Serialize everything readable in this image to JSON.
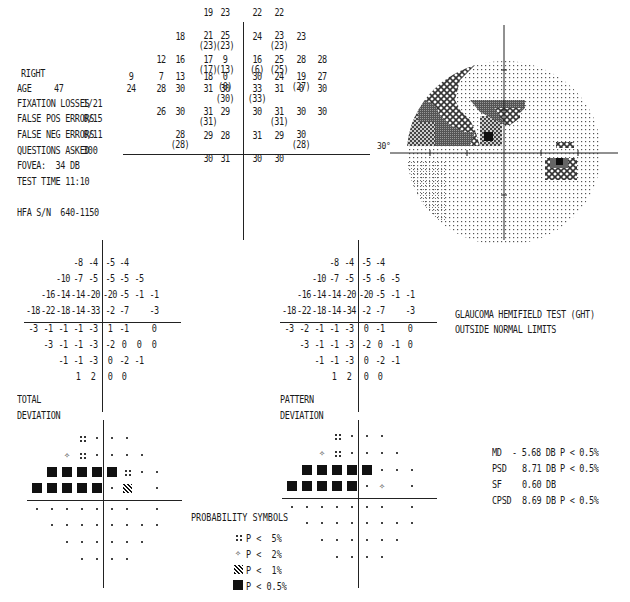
{
  "header": {
    "eye": "RIGHT",
    "age_label": "AGE",
    "age_value": "47",
    "fixation_label": "FIXATION LOSSES",
    "fixation_value": "1/21",
    "false_pos_label": "FALSE POS ERRORS",
    "false_pos_value": "0/15",
    "false_neg_label": "FALSE NEG ERRORS",
    "false_neg_value": "0/11",
    "questions_label": "QUESTIONS ASKED",
    "questions_value": "300",
    "fovea": "FOVEA:  34 DB",
    "test_time": "TEST TIME 11:10",
    "serial": "HFA S/N  640-1150"
  },
  "sensitivity": {
    "rows": [
      {
        "y": 15,
        "cells": [
          {
            "c": 3,
            "v": "19"
          },
          {
            "c": 4,
            "v": "23"
          },
          {
            "c": 5,
            "v": "22"
          },
          {
            "c": 6,
            "v": "22"
          }
        ]
      },
      {
        "y": 40,
        "cells": [
          {
            "c": 2,
            "v": "18"
          },
          {
            "c": 3,
            "v": "21",
            "s": "(23)"
          },
          {
            "c": 4,
            "v": "25",
            "s": "(23)"
          },
          {
            "c": 5,
            "v": "24"
          },
          {
            "c": 6,
            "v": "23",
            "s": "(23)"
          },
          {
            "c": 7,
            "v": "23"
          }
        ]
      },
      {
        "y": 64,
        "cells": [
          {
            "c": 1,
            "v": "12"
          },
          {
            "c": 2,
            "v": "16"
          },
          {
            "c": 3,
            "v": "17",
            "s": "(17)"
          },
          {
            "c": 4,
            "v": "9",
            "s": "(13)"
          },
          {
            "c": 5,
            "v": "16",
            "s": "(6)"
          },
          {
            "c": 6,
            "v": "25",
            "s": "(25)"
          },
          {
            "c": 7,
            "v": "28"
          },
          {
            "c": 8,
            "v": "28"
          }
        ]
      },
      {
        "y": 88,
        "cells": [
          {
            "c": 0,
            "v": "9"
          },
          {
            "c": 1,
            "v": "7"
          },
          {
            "c": 2,
            "v": "13"
          },
          {
            "c": 3,
            "v": "18"
          },
          {
            "c": 4,
            "v": "0",
            "s": "(0)"
          },
          {
            "c": 5,
            "v": "30"
          },
          {
            "c": 6,
            "v": "24"
          },
          {
            "c": 7,
            "v": "19",
            "s": "(27)"
          },
          {
            "c": 8,
            "v": "27"
          }
        ]
      },
      {
        "y": 106,
        "cells": [
          {
            "c": 0,
            "v": "24"
          },
          {
            "c": 1,
            "v": "28"
          },
          {
            "c": 2,
            "v": "30"
          },
          {
            "c": 3,
            "v": "31"
          },
          {
            "c": 4,
            "v": "30",
            "s": "(30)"
          },
          {
            "c": 5,
            "v": "33",
            "s": "(33)"
          },
          {
            "c": 6,
            "v": "31"
          },
          {
            "c": 7,
            "v": "0"
          },
          {
            "c": 8,
            "v": "30"
          }
        ]
      },
      {
        "y": 131,
        "cells": [
          {
            "c": 1,
            "v": "26"
          },
          {
            "c": 2,
            "v": "30"
          },
          {
            "c": 3,
            "v": "31",
            "s": "(31)"
          },
          {
            "c": 4,
            "v": "29"
          },
          {
            "c": 5,
            "v": "30"
          },
          {
            "c": 6,
            "v": "31",
            "s": "(31)"
          },
          {
            "c": 7,
            "v": "30"
          },
          {
            "c": 8,
            "v": "30"
          }
        ]
      },
      {
        "y": 154,
        "cells": [
          {
            "c": 2,
            "v": "28",
            "s": "(28)"
          },
          {
            "c": 3,
            "v": "29"
          },
          {
            "c": 4,
            "v": "28"
          },
          {
            "c": 5,
            "v": "31"
          },
          {
            "c": 6,
            "v": "29"
          },
          {
            "c": 7,
            "v": "30",
            "s": "(28)"
          }
        ]
      },
      {
        "y": 178,
        "cells": [
          {
            "c": 3,
            "v": "30"
          },
          {
            "c": 4,
            "v": "31"
          },
          {
            "c": 5,
            "v": "30"
          },
          {
            "c": 6,
            "v": "30"
          }
        ]
      }
    ]
  },
  "grayscale": {
    "label_30": "30°"
  },
  "total_deviation": {
    "label_line1": "TOTAL",
    "label_line2": "DEVIATION",
    "rows": [
      {
        "cells": [
          {
            "c": 3,
            "v": "-8"
          },
          {
            "c": 4,
            "v": "-4"
          },
          {
            "c": 5,
            "v": "-5"
          },
          {
            "c": 6,
            "v": "-4"
          }
        ]
      },
      {
        "cells": [
          {
            "c": 2,
            "v": "-10"
          },
          {
            "c": 3,
            "v": "-7"
          },
          {
            "c": 4,
            "v": "-5"
          },
          {
            "c": 5,
            "v": "-5"
          },
          {
            "c": 6,
            "v": "-5"
          },
          {
            "c": 7,
            "v": "-5"
          }
        ]
      },
      {
        "cells": [
          {
            "c": 1,
            "v": "-16"
          },
          {
            "c": 2,
            "v": "-14"
          },
          {
            "c": 3,
            "v": "-14"
          },
          {
            "c": 4,
            "v": "-20"
          },
          {
            "c": 5,
            "v": "-20"
          },
          {
            "c": 6,
            "v": "-5"
          },
          {
            "c": 7,
            "v": "-1"
          },
          {
            "c": 8,
            "v": "-1"
          }
        ]
      },
      {
        "cells": [
          {
            "c": 0,
            "v": "-18"
          },
          {
            "c": 1,
            "v": "-22"
          },
          {
            "c": 2,
            "v": "-18"
          },
          {
            "c": 3,
            "v": "-14"
          },
          {
            "c": 4,
            "v": "-33"
          },
          {
            "c": 5,
            "v": "-2"
          },
          {
            "c": 6,
            "v": "-7"
          },
          {
            "c": 8,
            "v": "-3"
          }
        ]
      },
      {
        "cells": [
          {
            "c": 0,
            "v": "-3"
          },
          {
            "c": 1,
            "v": "-1"
          },
          {
            "c": 2,
            "v": "-1"
          },
          {
            "c": 3,
            "v": "-1"
          },
          {
            "c": 4,
            "v": "-3"
          },
          {
            "c": 5,
            "v": "1"
          },
          {
            "c": 6,
            "v": "-1"
          },
          {
            "c": 8,
            "v": "0"
          }
        ]
      },
      {
        "cells": [
          {
            "c": 1,
            "v": "-3"
          },
          {
            "c": 2,
            "v": "-1"
          },
          {
            "c": 3,
            "v": "-1"
          },
          {
            "c": 4,
            "v": "-3"
          },
          {
            "c": 5,
            "v": "-2"
          },
          {
            "c": 6,
            "v": "0"
          },
          {
            "c": 7,
            "v": "0"
          },
          {
            "c": 8,
            "v": "0"
          }
        ]
      },
      {
        "cells": [
          {
            "c": 2,
            "v": "-1"
          },
          {
            "c": 3,
            "v": "-1"
          },
          {
            "c": 4,
            "v": "-3"
          },
          {
            "c": 5,
            "v": "0"
          },
          {
            "c": 6,
            "v": "-2"
          },
          {
            "c": 7,
            "v": "-1"
          }
        ]
      },
      {
        "cells": [
          {
            "c": 3,
            "v": "1"
          },
          {
            "c": 4,
            "v": "2"
          },
          {
            "c": 5,
            "v": "0"
          },
          {
            "c": 6,
            "v": "0"
          }
        ]
      }
    ]
  },
  "pattern_deviation": {
    "label_line1": "PATTERN",
    "label_line2": "DEVIATION",
    "rows": [
      {
        "cells": [
          {
            "c": 3,
            "v": "-8"
          },
          {
            "c": 4,
            "v": "-4"
          },
          {
            "c": 5,
            "v": "-5"
          },
          {
            "c": 6,
            "v": "-4"
          }
        ]
      },
      {
        "cells": [
          {
            "c": 2,
            "v": "-10"
          },
          {
            "c": 3,
            "v": "-7"
          },
          {
            "c": 4,
            "v": "-5"
          },
          {
            "c": 5,
            "v": "-5"
          },
          {
            "c": 6,
            "v": "-6"
          },
          {
            "c": 7,
            "v": "-5"
          }
        ]
      },
      {
        "cells": [
          {
            "c": 1,
            "v": "-16"
          },
          {
            "c": 2,
            "v": "-14"
          },
          {
            "c": 3,
            "v": "-14"
          },
          {
            "c": 4,
            "v": "-20"
          },
          {
            "c": 5,
            "v": "-20"
          },
          {
            "c": 6,
            "v": "-5"
          },
          {
            "c": 7,
            "v": "-1"
          },
          {
            "c": 8,
            "v": "-1"
          }
        ]
      },
      {
        "cells": [
          {
            "c": 0,
            "v": "-18"
          },
          {
            "c": 1,
            "v": "-22"
          },
          {
            "c": 2,
            "v": "-18"
          },
          {
            "c": 3,
            "v": "-14"
          },
          {
            "c": 4,
            "v": "-34"
          },
          {
            "c": 5,
            "v": "-2"
          },
          {
            "c": 6,
            "v": "-7"
          },
          {
            "c": 8,
            "v": "-3"
          }
        ]
      },
      {
        "cells": [
          {
            "c": 0,
            "v": "-3"
          },
          {
            "c": 1,
            "v": "-2"
          },
          {
            "c": 2,
            "v": "-1"
          },
          {
            "c": 3,
            "v": "-1"
          },
          {
            "c": 4,
            "v": "-3"
          },
          {
            "c": 5,
            "v": "0"
          },
          {
            "c": 6,
            "v": "-1"
          },
          {
            "c": 8,
            "v": "0"
          }
        ]
      },
      {
        "cells": [
          {
            "c": 1,
            "v": "-3"
          },
          {
            "c": 2,
            "v": "-1"
          },
          {
            "c": 3,
            "v": "-1"
          },
          {
            "c": 4,
            "v": "-3"
          },
          {
            "c": 5,
            "v": "-2"
          },
          {
            "c": 6,
            "v": "0"
          },
          {
            "c": 7,
            "v": "-1"
          },
          {
            "c": 8,
            "v": "0"
          }
        ]
      },
      {
        "cells": [
          {
            "c": 2,
            "v": "-1"
          },
          {
            "c": 3,
            "v": "-1"
          },
          {
            "c": 4,
            "v": "-3"
          },
          {
            "c": 5,
            "v": "0"
          },
          {
            "c": 6,
            "v": "-2"
          },
          {
            "c": 7,
            "v": "-1"
          }
        ]
      },
      {
        "cells": [
          {
            "c": 3,
            "v": "1"
          },
          {
            "c": 4,
            "v": "2"
          },
          {
            "c": 5,
            "v": "0"
          },
          {
            "c": 6,
            "v": "0"
          }
        ]
      }
    ]
  },
  "total_prob": {
    "rows": [
      [
        "",
        "",
        "",
        "p5",
        "dot",
        "dot",
        "dot",
        "",
        ""
      ],
      [
        "",
        "",
        "p2",
        "p5",
        "dot",
        "dot",
        "dot",
        "dot",
        ""
      ],
      [
        "",
        "black",
        "black",
        "black",
        "black",
        "black",
        "p5",
        "dot",
        "dot"
      ],
      [
        "black",
        "black",
        "black",
        "black",
        "black",
        "dot",
        "p1",
        "",
        "dot"
      ],
      [
        "dot",
        "dot",
        "dot",
        "dot",
        "dot",
        "dot",
        "dot",
        "",
        "dot"
      ],
      [
        "",
        "dot",
        "dot",
        "dot",
        "dot",
        "dot",
        "dot",
        "dot",
        "dot"
      ],
      [
        "",
        "",
        "dot",
        "dot",
        "dot",
        "dot",
        "dot",
        "dot",
        ""
      ],
      [
        "",
        "",
        "",
        "dot",
        "dot",
        "dot",
        "dot",
        "",
        ""
      ]
    ]
  },
  "pattern_prob": {
    "rows": [
      [
        "",
        "",
        "",
        "p5",
        "dot",
        "dot",
        "dot",
        "",
        ""
      ],
      [
        "",
        "",
        "p2",
        "p5",
        "dot",
        "dot",
        "dot",
        "dot",
        ""
      ],
      [
        "",
        "black",
        "black",
        "black",
        "black",
        "black",
        "dot",
        "dot",
        "dot"
      ],
      [
        "black",
        "black",
        "black",
        "black",
        "black",
        "dot",
        "p2",
        "",
        "dot"
      ],
      [
        "dot",
        "dot",
        "dot",
        "dot",
        "dot",
        "dot",
        "dot",
        "",
        "dot"
      ],
      [
        "",
        "dot",
        "dot",
        "dot",
        "dot",
        "dot",
        "dot",
        "dot",
        "dot"
      ],
      [
        "",
        "",
        "dot",
        "dot",
        "dot",
        "dot",
        "dot",
        "dot",
        ""
      ],
      [
        "",
        "",
        "",
        "dot",
        "dot",
        "dot",
        "dot",
        "",
        ""
      ]
    ]
  },
  "ght": {
    "line1": "GLAUCOMA HEMIFIELD TEST (GHT)",
    "line2": "OUTSIDE NORMAL LIMITS"
  },
  "indices": [
    {
      "label": "MD",
      "value": "- 5.68 DB",
      "p": "P < 0.5%"
    },
    {
      "label": "PSD",
      "value": "8.71 DB",
      "p": "P < 0.5%"
    },
    {
      "label": "SF",
      "value": "0.60 DB",
      "p": ""
    },
    {
      "label": "CPSD",
      "value": "8.69 DB",
      "p": "P < 0.5%"
    }
  ],
  "legend": {
    "title": "PROBABILITY SYMBOLS",
    "items": [
      {
        "sym": "p5",
        "text": "P <  5%"
      },
      {
        "sym": "p2",
        "text": "P <  2%"
      },
      {
        "sym": "p1",
        "text": "P <  1%"
      },
      {
        "sym": "black",
        "text": "P < 0.5%"
      }
    ]
  }
}
